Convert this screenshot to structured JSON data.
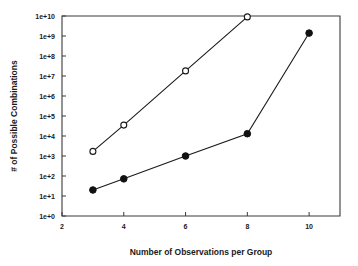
{
  "chart_data": {
    "type": "line",
    "title": "",
    "xlabel": "Number of Observations per Group",
    "ylabel": "# of Possible Combinations",
    "xlim": [
      2,
      11
    ],
    "ylim": [
      1,
      10000000000
    ],
    "yscale": "log",
    "grid": false,
    "legend": "none",
    "xticks": [
      2,
      4,
      6,
      8,
      10
    ],
    "xtick_labels": [
      "2",
      "4",
      "6",
      "8",
      "10"
    ],
    "yticks": [
      1,
      10,
      100,
      1000,
      10000,
      100000,
      1000000,
      10000000,
      100000000,
      1000000000,
      10000000000
    ],
    "ytick_labels": [
      "1e+0",
      "1e+1",
      "1e+2",
      "1e+3",
      "1e+4",
      "1e+5",
      "1e+6",
      "1e+7",
      "1e+8",
      "1e+9",
      "1e+10"
    ],
    "series": [
      {
        "name": "open-circle-series",
        "marker": "open-circle",
        "x": [
          3,
          4,
          6,
          8
        ],
        "values": [
          1700,
          35000,
          18000000,
          9000000000
        ]
      },
      {
        "name": "filled-circle-series",
        "marker": "filled-circle",
        "x": [
          3,
          4,
          6,
          8,
          10
        ],
        "values": [
          20,
          72,
          1000,
          13000,
          1400000000
        ]
      }
    ]
  }
}
